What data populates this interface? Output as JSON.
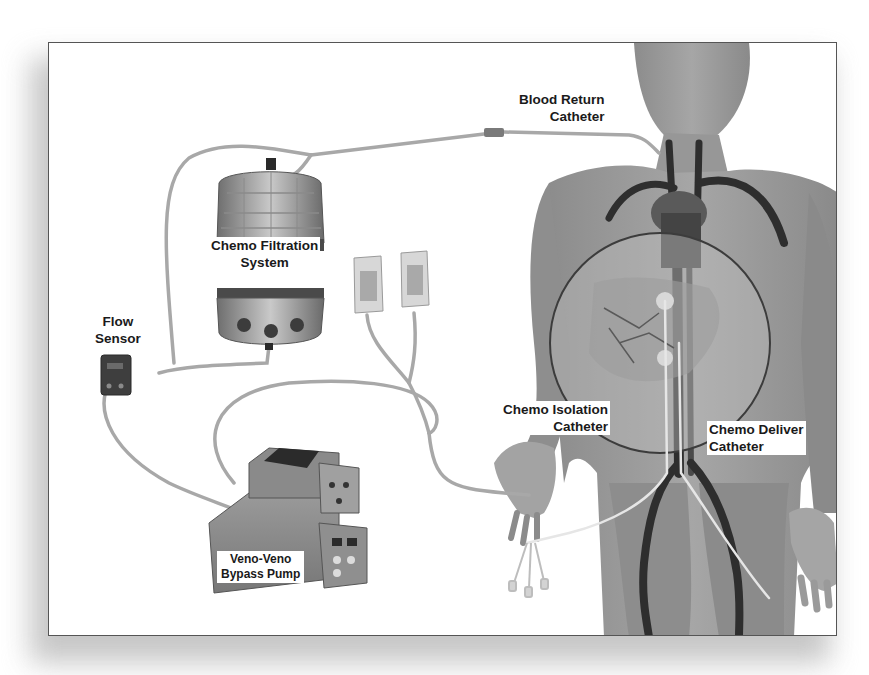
{
  "diagram": {
    "type": "medical-device-setup",
    "colors": {
      "frame_border": "#555555",
      "background": "#ffffff",
      "skin": "#9a9a9a",
      "vessels": "#2e2e2e",
      "tubing": "#a8a8a8",
      "label_text": "#1a1a1a"
    },
    "labels": {
      "blood_return_catheter": {
        "line1": "Blood Return",
        "line2": "Catheter"
      },
      "chemo_filtration_system": {
        "line1": "Chemo Filtration",
        "line2": "System"
      },
      "flow_sensor": {
        "line1": "Flow",
        "line2": "Sensor"
      },
      "chemo_isolation_catheter": {
        "line1": "Chemo Isolation",
        "line2": "Catheter"
      },
      "chemo_deliver_catheter": {
        "line1": "Chemo Deliver",
        "line2": "Catheter"
      },
      "veno_veno_bypass_pump": {
        "line1": "Veno-Veno",
        "line2": "Bypass Pump"
      }
    },
    "components": [
      "human-body-figure",
      "blood-return-catheter",
      "chemo-filtration-system",
      "iv-bags",
      "flow-sensor",
      "veno-veno-bypass-pump",
      "chemo-isolation-catheter",
      "chemo-deliver-catheter",
      "liver-magnification-circle"
    ]
  }
}
